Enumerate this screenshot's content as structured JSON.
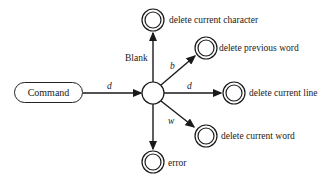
{
  "diagram": {
    "start_node": {
      "label": "Command"
    },
    "center_node": {
      "label": ""
    },
    "transitions": [
      {
        "from": "Command",
        "to": "center",
        "label": "d"
      },
      {
        "from": "center",
        "to": "delete current character",
        "label": "Blank"
      },
      {
        "from": "center",
        "to": "delete previous word",
        "label": "b"
      },
      {
        "from": "center",
        "to": "delete current line",
        "label": "d"
      },
      {
        "from": "center",
        "to": "delete current word",
        "label": "w"
      },
      {
        "from": "center",
        "to": "error",
        "label": ""
      }
    ],
    "final_states": [
      {
        "label": "delete current character"
      },
      {
        "label": "delete previous word"
      },
      {
        "label": "delete current line"
      },
      {
        "label": "delete current word"
      },
      {
        "label": "error"
      }
    ]
  }
}
